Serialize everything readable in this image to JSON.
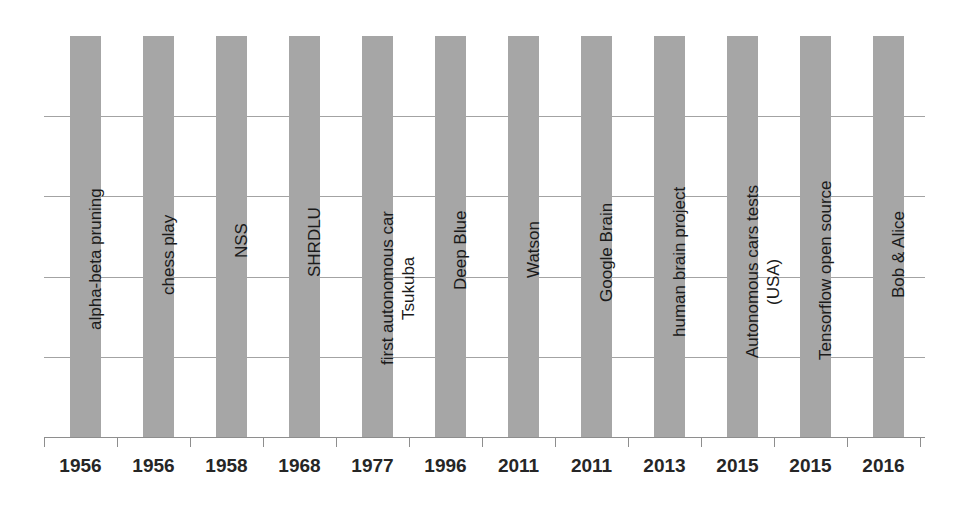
{
  "chart_data": {
    "type": "bar",
    "title": "",
    "subtitle": "",
    "xlabel": "",
    "ylabel": "",
    "categories": [
      "1956",
      "1956",
      "1958",
      "1968",
      "1977",
      "1996",
      "2011",
      "2011",
      "2013",
      "2015",
      "2015",
      "2016"
    ],
    "values": [
      1,
      1,
      1,
      1,
      1,
      1,
      1,
      1,
      1,
      1,
      1,
      1
    ],
    "ylim": [
      0,
      1
    ],
    "grid": true,
    "legend": "none",
    "gridline_count": 4,
    "bar_color": "#a6a6a6",
    "axis_color": "#8e8e8e",
    "gridline_color": "#a3a3a3",
    "label_color": "#1a1a1a",
    "annotations": [
      {
        "label": "alpha-beta pruning",
        "year": "1956",
        "extra": ""
      },
      {
        "label": "chess play",
        "year": "1956",
        "extra": ""
      },
      {
        "label": "NSS",
        "year": "1958",
        "extra": ""
      },
      {
        "label": "SHRDLU",
        "year": "1968",
        "extra": ""
      },
      {
        "label": "first autonomous car",
        "year": "1977",
        "extra": "Tsukuba"
      },
      {
        "label": "Deep Blue",
        "year": "1996",
        "extra": ""
      },
      {
        "label": "Watson",
        "year": "2011",
        "extra": ""
      },
      {
        "label": "Google Brain",
        "year": "2011",
        "extra": ""
      },
      {
        "label": "human brain project",
        "year": "2013",
        "extra": ""
      },
      {
        "label": "Autonomous cars tests",
        "year": "2015",
        "extra": "(USA)"
      },
      {
        "label": "Tensorflow open source",
        "year": "2015",
        "extra": ""
      },
      {
        "label": "Bob & Alice",
        "year": "2016",
        "extra": ""
      }
    ]
  },
  "bars": [
    {
      "name": "alpha-beta pruning",
      "label": "alpha-beta pruning",
      "extra": "",
      "year": "1956",
      "x": 70,
      "label_x": 87,
      "label_y": 330,
      "extra_x": 0,
      "extra_y": 0
    },
    {
      "name": "chess play",
      "label": "chess play",
      "extra": "",
      "year": "1956",
      "x": 143,
      "label_x": 160,
      "label_y": 295,
      "extra_x": 0,
      "extra_y": 0
    },
    {
      "name": "NSS",
      "label": "NSS",
      "extra": "",
      "year": "1958",
      "x": 216,
      "label_x": 233,
      "label_y": 258,
      "extra_x": 0,
      "extra_y": 0
    },
    {
      "name": "SHRDLU",
      "label": "SHRDLU",
      "extra": "",
      "year": "1968",
      "x": 289,
      "label_x": 306,
      "label_y": 277,
      "extra_x": 0,
      "extra_y": 0
    },
    {
      "name": "first autonomous car",
      "label": "first autonomous car",
      "extra": "Tsukuba",
      "year": "1977",
      "x": 362,
      "label_x": 379,
      "label_y": 365,
      "extra_x": 400,
      "extra_y": 320
    },
    {
      "name": "Deep Blue",
      "label": "Deep Blue",
      "extra": "",
      "year": "1996",
      "x": 435,
      "label_x": 452,
      "label_y": 290,
      "extra_x": 0,
      "extra_y": 0
    },
    {
      "name": "Watson",
      "label": "Watson",
      "extra": "",
      "year": "2011",
      "x": 508,
      "label_x": 525,
      "label_y": 278,
      "extra_x": 0,
      "extra_y": 0
    },
    {
      "name": "Google Brain",
      "label": "Google Brain",
      "extra": "",
      "year": "2011",
      "x": 581,
      "label_x": 598,
      "label_y": 302,
      "extra_x": 0,
      "extra_y": 0
    },
    {
      "name": "human brain project",
      "label": "human brain project",
      "extra": "",
      "year": "2013",
      "x": 654,
      "label_x": 671,
      "label_y": 337,
      "extra_x": 0,
      "extra_y": 0
    },
    {
      "name": "Autonomous cars tests",
      "label": "Autonomous cars tests",
      "extra": "(USA)",
      "year": "2015",
      "x": 727,
      "label_x": 744,
      "label_y": 358,
      "extra_x": 765,
      "extra_y": 305
    },
    {
      "name": "Tensorflow open source",
      "label": "Tensorflow open source",
      "extra": "",
      "year": "2015",
      "x": 800,
      "label_x": 817,
      "label_y": 360,
      "extra_x": 0,
      "extra_y": 0
    },
    {
      "name": "Bob & Alice",
      "label": "Bob & Alice",
      "extra": "",
      "year": "2016",
      "x": 873,
      "label_x": 890,
      "label_y": 298,
      "extra_x": 0,
      "extra_y": 0
    }
  ],
  "gridlines": [
    80,
    160,
    241,
    321
  ],
  "ticks": [
    44,
    117,
    190,
    263,
    336,
    409,
    482,
    555,
    628,
    701,
    774,
    847,
    920
  ],
  "year_labels": [
    {
      "value": "1956",
      "x": 44
    },
    {
      "value": "1956",
      "x": 117
    },
    {
      "value": "1958",
      "x": 190
    },
    {
      "value": "1968",
      "x": 263
    },
    {
      "value": "1977",
      "x": 336
    },
    {
      "value": "1996",
      "x": 409
    },
    {
      "value": "2011",
      "x": 482
    },
    {
      "value": "2011",
      "x": 555
    },
    {
      "value": "2013",
      "x": 628
    },
    {
      "value": "2015",
      "x": 701
    },
    {
      "value": "2015",
      "x": 774
    },
    {
      "value": "2016",
      "x": 847
    }
  ]
}
